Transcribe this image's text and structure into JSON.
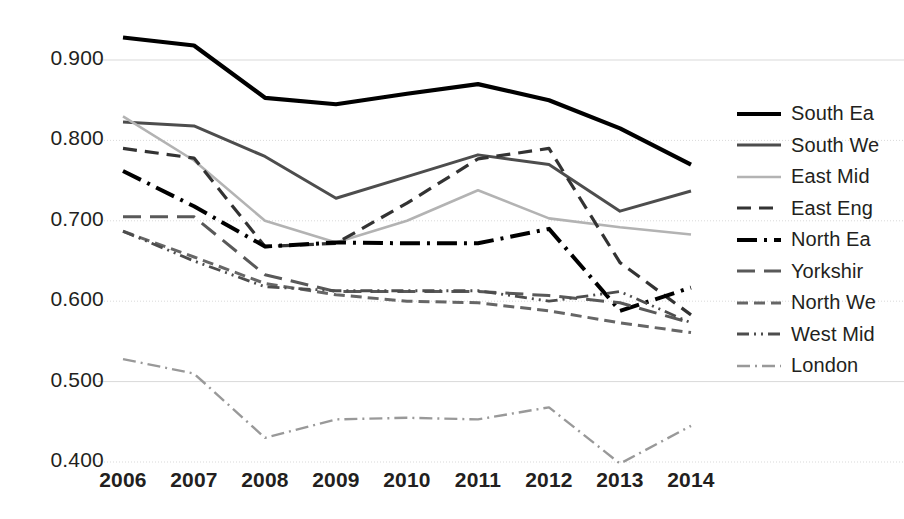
{
  "chart_data": {
    "type": "line",
    "title": "",
    "subtitle": "",
    "xlabel": "",
    "ylabel": "",
    "categories": [
      "2006",
      "2007",
      "2008",
      "2009",
      "2010",
      "2011",
      "2012",
      "2013",
      "2014"
    ],
    "x": [
      2006,
      2007,
      2008,
      2009,
      2010,
      2011,
      2012,
      2013,
      2014
    ],
    "ylim": [
      0.4,
      0.95
    ],
    "yticks": [
      0.4,
      0.5,
      0.6,
      0.7,
      0.8,
      0.9
    ],
    "ytick_labels": [
      "0.400",
      "0.500",
      "0.600",
      "0.700",
      "0.800",
      "0.900"
    ],
    "grid": true,
    "legend_position": "right",
    "series": [
      {
        "name": "South Ea",
        "dash": "solid",
        "width": 4.2,
        "color": "#000000",
        "values": [
          0.928,
          0.918,
          0.853,
          0.845,
          0.858,
          0.87,
          0.85,
          0.815,
          0.77
        ]
      },
      {
        "name": "South We",
        "dash": "solid",
        "width": 3.0,
        "color": "#4d4d4d",
        "values": [
          0.823,
          0.818,
          0.78,
          0.728,
          0.755,
          0.782,
          0.77,
          0.712,
          0.737
        ]
      },
      {
        "name": "East Mid",
        "dash": "solid",
        "width": 2.6,
        "color": "#b3b3b3",
        "values": [
          0.83,
          0.775,
          0.7,
          0.673,
          0.7,
          0.738,
          0.703,
          0.692,
          0.683
        ]
      },
      {
        "name": "East Eng",
        "dash": "dashed",
        "width": 3.2,
        "color": "#333333",
        "values": [
          0.79,
          0.778,
          0.668,
          0.672,
          0.722,
          0.777,
          0.79,
          0.648,
          0.583
        ]
      },
      {
        "name": "North Ea",
        "dash": "dashdot",
        "width": 4.0,
        "color": "#000000",
        "values": [
          0.762,
          0.718,
          0.668,
          0.673,
          0.672,
          0.672,
          0.69,
          0.588,
          0.617
        ]
      },
      {
        "name": "Yorkshir",
        "dash": "longdash",
        "width": 3.0,
        "color": "#595959",
        "values": [
          0.705,
          0.705,
          0.633,
          0.612,
          0.612,
          0.612,
          0.607,
          0.598,
          0.573
        ]
      },
      {
        "name": "North We",
        "dash": "shortdash",
        "width": 3.0,
        "color": "#666666",
        "values": [
          0.687,
          0.655,
          0.622,
          0.608,
          0.6,
          0.598,
          0.588,
          0.573,
          0.561
        ]
      },
      {
        "name": "West Mid",
        "dash": "dashdotdot",
        "width": 2.8,
        "color": "#4d4d4d",
        "values": [
          0.687,
          0.65,
          0.618,
          0.613,
          0.613,
          0.613,
          0.6,
          0.612,
          0.573
        ]
      },
      {
        "name": "London",
        "dash": "finedashdot",
        "width": 2.4,
        "color": "#999999",
        "values": [
          0.528,
          0.51,
          0.43,
          0.453,
          0.455,
          0.453,
          0.468,
          0.398,
          0.445
        ]
      }
    ]
  },
  "legend": {
    "items": [
      {
        "label": "South Ea"
      },
      {
        "label": "South We"
      },
      {
        "label": "East Mid"
      },
      {
        "label": "East Eng"
      },
      {
        "label": "North Ea"
      },
      {
        "label": "Yorkshir"
      },
      {
        "label": "North We"
      },
      {
        "label": "West Mid"
      },
      {
        "label": "London"
      }
    ]
  }
}
